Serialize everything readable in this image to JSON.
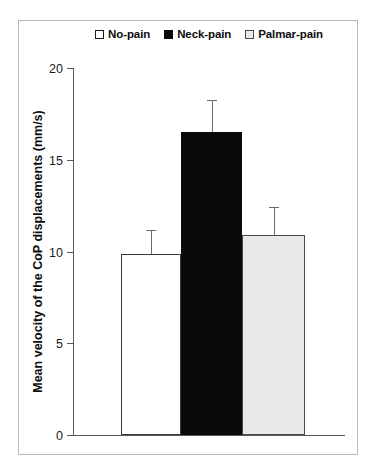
{
  "figure": {
    "background_color": "#ffffff",
    "frame_color": "#b9b9b9"
  },
  "legend": {
    "position": "top-center",
    "items": [
      {
        "label": "No-pain",
        "swatch_color": "#ffffff",
        "swatch_border": "#1a1a1a",
        "icon": "legend-swatch-icon"
      },
      {
        "label": "Neck-pain",
        "swatch_color": "#0a0a0a",
        "swatch_border": "#0a0a0a",
        "icon": "legend-swatch-icon"
      },
      {
        "label": "Palmar-pain",
        "swatch_color": "#e9e9e9",
        "swatch_border": "#4a4a4a",
        "icon": "legend-swatch-icon"
      }
    ]
  },
  "axes": {
    "y_title": "Mean velocity of the CoP displacements (mm/s)",
    "y_ticks": [
      "20",
      "15",
      "10",
      "5",
      "0"
    ],
    "x_title": ""
  },
  "chart_data": {
    "type": "bar",
    "title": "",
    "xlabel": "",
    "ylabel": "Mean velocity of the CoP displacements (mm/s)",
    "ylim": [
      0,
      20
    ],
    "yticks": [
      0,
      5,
      10,
      15,
      20
    ],
    "grid": false,
    "legend_position": "top-center",
    "categories": [
      "No-pain",
      "Neck-pain",
      "Palmar-pain"
    ],
    "values": [
      9.85,
      16.5,
      10.9
    ],
    "errors": [
      1.3,
      1.75,
      1.5
    ],
    "error_type": "upper-only",
    "colors": [
      "#ffffff",
      "#0a0a0a",
      "#e9e9e9"
    ],
    "series": [
      {
        "name": "Mean velocity of the CoP displacements",
        "values": [
          9.85,
          16.5,
          10.9
        ],
        "errors": [
          1.3,
          1.75,
          1.5
        ]
      }
    ]
  }
}
